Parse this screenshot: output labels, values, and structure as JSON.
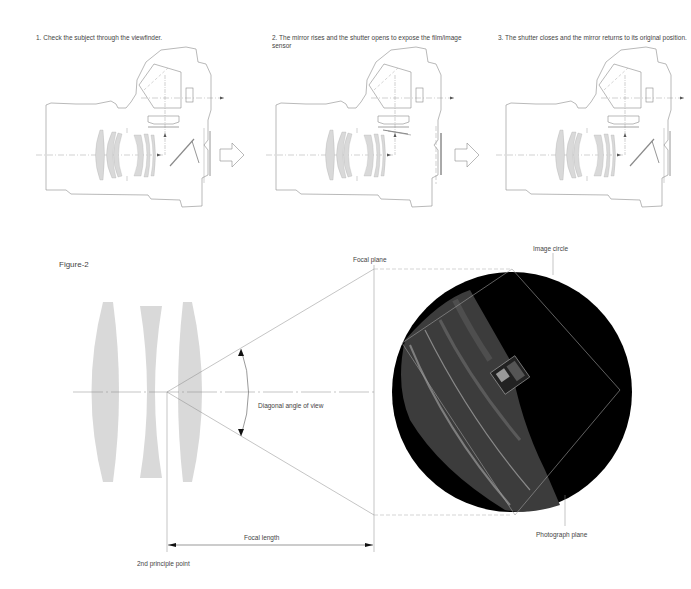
{
  "steps": [
    {
      "label": "1. Check the subject through the viewfinder."
    },
    {
      "label": "2. The mirror rises and the shutter opens to expose the film/image sensor"
    },
    {
      "label": "3. The shutter closes and the mirror returns to its original position."
    }
  ],
  "figure2": {
    "title": "Figure-2",
    "labels": {
      "focal_plane": "Focal plane",
      "image_circle": "Image circle",
      "diagonal_angle": "Diagonal angle of view",
      "focal_length": "Focal length",
      "principle_point": "2nd principle point",
      "photograph_plane": "Photograph plane"
    }
  },
  "colors": {
    "line": "#8a8a8a",
    "lens_fill": "#d9d9d9",
    "image_circle_bg": "#000000"
  }
}
